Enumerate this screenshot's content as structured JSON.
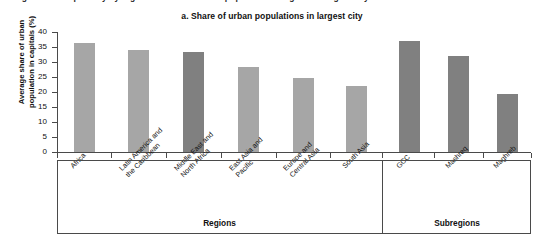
{
  "cutoff_caption": "Figure: Urban primacy by region — share of urban population living in the largest city",
  "figure": {
    "title": "a. Share of urban populations in largest city",
    "y_axis_title": "Average share of urban\npopulation in capitals (%)"
  },
  "groups": [
    {
      "name": "regions-group",
      "label": "Regions"
    },
    {
      "name": "subregions-group",
      "label": "Subregions"
    }
  ],
  "colors": {
    "bar_light": "#a6a6a6",
    "bar_dark": "#808080",
    "axis": "#4a4a4a",
    "text": "#111111",
    "background": "#ffffff"
  },
  "chart_data": {
    "type": "bar",
    "title": "a. Share of urban populations in largest city",
    "xlabel": "",
    "ylabel": "Average share of urban population in capitals (%)",
    "ylim": [
      0,
      40
    ],
    "ytick_labels": [
      "0",
      "5",
      "10",
      "15",
      "20",
      "25",
      "30",
      "35",
      "40"
    ],
    "yticks": [
      0,
      5,
      10,
      15,
      20,
      25,
      30,
      35,
      40
    ],
    "grid": false,
    "legend": "none",
    "categories": [
      "Africa",
      "Latin America and\nthe Caribbean",
      "Middle East and\nNorth Africa",
      "East Asia and\nPacific",
      "Europe and\nCentral Asia",
      "South Asia",
      "GCC",
      "Mashreq",
      "Maghreb"
    ],
    "values": [
      36.5,
      34.0,
      33.4,
      28.4,
      24.7,
      22.1,
      37.0,
      32.0,
      19.4
    ],
    "bar_colors": [
      "#a6a6a6",
      "#a6a6a6",
      "#808080",
      "#a6a6a6",
      "#a6a6a6",
      "#a6a6a6",
      "#808080",
      "#808080",
      "#808080"
    ],
    "groups": [
      "Regions",
      "Regions",
      "Regions",
      "Regions",
      "Regions",
      "Regions",
      "Subregions",
      "Subregions",
      "Subregions"
    ]
  }
}
